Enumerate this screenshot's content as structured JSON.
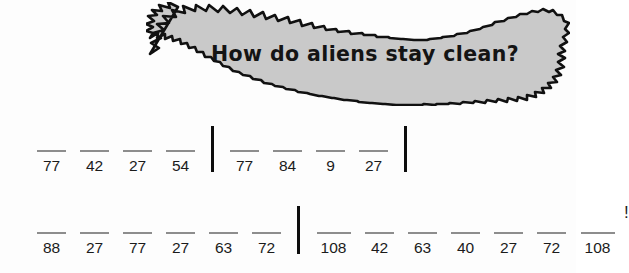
{
  "riddle": {
    "question": "How do aliens stay clean?",
    "bubble_fill": "#c9c9c9",
    "bubble_stroke": "#111111"
  },
  "answer_key": {
    "blank_char": "_",
    "trailing_punctuation": "!"
  },
  "rows": [
    {
      "id": "row-1",
      "groups": [
        {
          "id": "row-1-group-1",
          "numbers": [
            "77",
            "42",
            "27",
            "54"
          ]
        },
        {
          "id": "row-1-group-2",
          "numbers": [
            "77",
            "84",
            "9",
            "27"
          ]
        }
      ],
      "trailing": ""
    },
    {
      "id": "row-2",
      "groups": [
        {
          "id": "row-2-group-1",
          "numbers": [
            "88",
            "27",
            "77",
            "27",
            "63",
            "72"
          ]
        },
        {
          "id": "row-2-group-2",
          "numbers": [
            "108",
            "42",
            "63",
            "40",
            "27",
            "72",
            "108"
          ]
        }
      ],
      "trailing": "!"
    }
  ]
}
